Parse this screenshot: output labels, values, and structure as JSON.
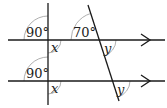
{
  "diagram": {
    "type": "parallel-lines-angles",
    "colors": {
      "line": "#1a1a1a",
      "arc": "#9a9a9a",
      "text": "#222222"
    },
    "labels": {
      "top_left_angle": "90°",
      "top_transversal_angle": "70°",
      "top_x": "x",
      "top_y": "y",
      "bottom_left_angle": "90°",
      "bottom_x": "x",
      "bottom_y": "y"
    },
    "parallel_lines": 2,
    "arrow_direction": "right"
  }
}
